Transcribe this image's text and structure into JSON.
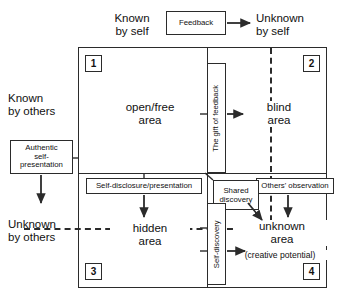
{
  "diagram": {
    "stroke_color": "#2b2b2b",
    "background_color": "#ffffff"
  },
  "axes": {
    "top_left": "Known\nby self",
    "top_right": "Unknown\nby self",
    "left_top": "Known\nby others",
    "left_bottom": "Unknown\nby others"
  },
  "quadrants": [
    {
      "number": "1",
      "name": "open/free\narea",
      "sub": ""
    },
    {
      "number": "2",
      "name": "blind\narea",
      "sub": ""
    },
    {
      "number": "3",
      "name": "hidden\narea",
      "sub": ""
    },
    {
      "number": "4",
      "name": "unknown\narea",
      "sub": "(creative potential)"
    }
  ],
  "process_boxes": {
    "feedback": "Feedback",
    "authentic_self_presentation": "Authentic\nself-\npresentation",
    "gift_of_feedback": "The gift of feedback",
    "self_disclosure": "Self-disclosure/presentation",
    "shared_discovery": "Shared\ndiscovery",
    "others_observation": "Others' observation",
    "self_discovery": "Self-discovery"
  },
  "arrows": [
    {
      "name": "feedback-arrow",
      "direction": "right"
    },
    {
      "name": "gift-of-feedback-arrow",
      "direction": "right"
    },
    {
      "name": "authentic-self-presentation-arrow",
      "direction": "down"
    },
    {
      "name": "self-disclosure-arrow",
      "direction": "down"
    },
    {
      "name": "others-observation-arrow",
      "direction": "down"
    },
    {
      "name": "shared-discovery-arrow",
      "direction": "down-right"
    },
    {
      "name": "self-discovery-arrow",
      "direction": "right"
    }
  ]
}
